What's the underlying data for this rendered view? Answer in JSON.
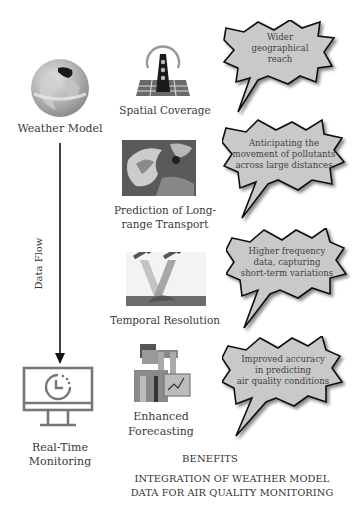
{
  "weather_model": {
    "label": "Weather Model",
    "icon": "globe-icon"
  },
  "data_flow": {
    "label": "Data Flow",
    "icon": "arrow-down-icon"
  },
  "real_time": {
    "label_line1": "Real-Time",
    "label_line2": "Monitoring",
    "icon": "monitor-clock-icon"
  },
  "benefits": [
    {
      "label_line1": "Spatial Coverage",
      "label_line2": "",
      "icon": "radio-tower-map-icon",
      "bubble": [
        "Wider",
        "geographical",
        "reach"
      ]
    },
    {
      "label_line1": "Prediction of Long-",
      "label_line2": "range Transport",
      "icon": "satellite-weather-image-icon",
      "bubble": [
        "Anticipating the",
        "movement of pollutants",
        "across large distances"
      ]
    },
    {
      "label_line1": "Temporal Resolution",
      "label_line2": "",
      "icon": "satellites-beam-icon",
      "bubble": [
        "Higher frequency",
        "data, capturing",
        "short-term variations"
      ]
    },
    {
      "label_line1": "Enhanced",
      "label_line2": "Forecasting",
      "icon": "forecaster-chart-icon",
      "bubble": [
        "Improved accuracy",
        "in predicting",
        "air quality conditions"
      ]
    }
  ],
  "benefits_heading": "BENEFITS",
  "title_line1": "INTEGRATION OF WEATHER MODEL",
  "title_line2": "DATA FOR AIR QUALITY MONITORING"
}
